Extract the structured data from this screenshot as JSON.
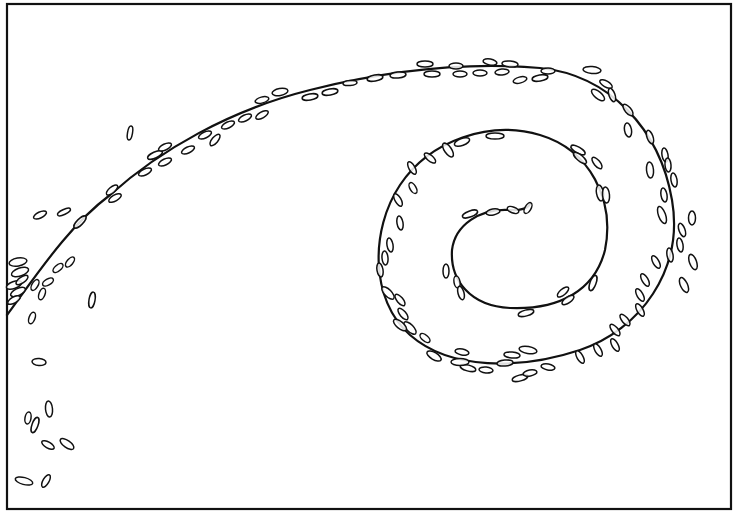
{
  "figure": {
    "width": 735,
    "height": 520,
    "background": "#ffffff",
    "ink": "#111111",
    "frame": {
      "x": 7,
      "y": 4,
      "w": 724,
      "h": 505,
      "stroke_width": 2.2
    },
    "spiral_path": "M 7 315 C 40 270, 70 225, 110 195 C 160 150, 230 110, 310 90 C 390 70, 470 62, 540 68 C 610 75, 660 130, 672 200 C 684 270, 640 330, 580 350 C 520 370, 450 370, 410 335 C 370 300, 370 230, 400 185 C 430 140, 490 120, 540 135 C 590 150, 615 200, 605 250 C 595 290, 560 310, 510 308 C 470 306, 450 280, 452 250 C 455 225, 480 208, 510 210 C 520 211, 528 208, 530 204",
    "particles": [
      {
        "cx": 18,
        "cy": 262,
        "rx": 9,
        "ry": 4,
        "rot": -10
      },
      {
        "cx": 20,
        "cy": 272,
        "rx": 9,
        "ry": 4,
        "rot": -20
      },
      {
        "cx": 14,
        "cy": 285,
        "rx": 8,
        "ry": 3.5,
        "rot": -20
      },
      {
        "cx": 18,
        "cy": 292,
        "rx": 8,
        "ry": 3.5,
        "rot": -25
      },
      {
        "cx": 14,
        "cy": 300,
        "rx": 7,
        "ry": 3,
        "rot": -30
      },
      {
        "cx": 22,
        "cy": 280,
        "rx": 7,
        "ry": 3,
        "rot": -35
      },
      {
        "cx": 35,
        "cy": 285,
        "rx": 6,
        "ry": 3,
        "rot": -60
      },
      {
        "cx": 42,
        "cy": 294,
        "rx": 6,
        "ry": 3,
        "rot": -70
      },
      {
        "cx": 48,
        "cy": 282,
        "rx": 6,
        "ry": 3,
        "rot": -30
      },
      {
        "cx": 58,
        "cy": 268,
        "rx": 6,
        "ry": 3,
        "rot": -40
      },
      {
        "cx": 70,
        "cy": 262,
        "rx": 6,
        "ry": 3,
        "rot": -50
      },
      {
        "cx": 32,
        "cy": 318,
        "rx": 6,
        "ry": 3,
        "rot": -70
      },
      {
        "cx": 92,
        "cy": 300,
        "rx": 8,
        "ry": 3,
        "rot": -80
      },
      {
        "cx": 40,
        "cy": 215,
        "rx": 7,
        "ry": 3,
        "rot": -25
      },
      {
        "cx": 64,
        "cy": 212,
        "rx": 7,
        "ry": 2.5,
        "rot": -25
      },
      {
        "cx": 80,
        "cy": 222,
        "rx": 8,
        "ry": 3,
        "rot": -45
      },
      {
        "cx": 112,
        "cy": 190,
        "rx": 7,
        "ry": 3,
        "rot": -40
      },
      {
        "cx": 115,
        "cy": 198,
        "rx": 7,
        "ry": 3,
        "rot": -30
      },
      {
        "cx": 130,
        "cy": 133,
        "rx": 7,
        "ry": 2.5,
        "rot": -80
      },
      {
        "cx": 155,
        "cy": 155,
        "rx": 8,
        "ry": 3,
        "rot": -25
      },
      {
        "cx": 165,
        "cy": 147,
        "rx": 7,
        "ry": 3,
        "rot": -25
      },
      {
        "cx": 145,
        "cy": 172,
        "rx": 7,
        "ry": 3,
        "rot": -25
      },
      {
        "cx": 165,
        "cy": 162,
        "rx": 7,
        "ry": 3,
        "rot": -25
      },
      {
        "cx": 188,
        "cy": 150,
        "rx": 7,
        "ry": 3,
        "rot": -25
      },
      {
        "cx": 205,
        "cy": 135,
        "rx": 7,
        "ry": 3,
        "rot": -25
      },
      {
        "cx": 215,
        "cy": 140,
        "rx": 7,
        "ry": 3,
        "rot": -50
      },
      {
        "cx": 228,
        "cy": 125,
        "rx": 7,
        "ry": 3,
        "rot": -25
      },
      {
        "cx": 245,
        "cy": 118,
        "rx": 7,
        "ry": 3,
        "rot": -25
      },
      {
        "cx": 262,
        "cy": 115,
        "rx": 7,
        "ry": 3,
        "rot": -30
      },
      {
        "cx": 262,
        "cy": 100,
        "rx": 7,
        "ry": 3,
        "rot": -15
      },
      {
        "cx": 280,
        "cy": 92,
        "rx": 8,
        "ry": 3.5,
        "rot": -10
      },
      {
        "cx": 310,
        "cy": 97,
        "rx": 8,
        "ry": 3,
        "rot": -10
      },
      {
        "cx": 330,
        "cy": 92,
        "rx": 8,
        "ry": 3,
        "rot": -10
      },
      {
        "cx": 350,
        "cy": 83,
        "rx": 7,
        "ry": 2.5,
        "rot": -5
      },
      {
        "cx": 375,
        "cy": 78,
        "rx": 8,
        "ry": 3,
        "rot": -10
      },
      {
        "cx": 398,
        "cy": 75,
        "rx": 8,
        "ry": 3,
        "rot": -5
      },
      {
        "cx": 425,
        "cy": 64,
        "rx": 8,
        "ry": 3,
        "rot": 0
      },
      {
        "cx": 432,
        "cy": 74,
        "rx": 8,
        "ry": 3,
        "rot": 0
      },
      {
        "cx": 456,
        "cy": 66,
        "rx": 7,
        "ry": 3,
        "rot": 0
      },
      {
        "cx": 460,
        "cy": 74,
        "rx": 7,
        "ry": 3,
        "rot": 0
      },
      {
        "cx": 480,
        "cy": 73,
        "rx": 7,
        "ry": 3,
        "rot": 0
      },
      {
        "cx": 490,
        "cy": 62,
        "rx": 7,
        "ry": 3,
        "rot": 10
      },
      {
        "cx": 502,
        "cy": 72,
        "rx": 7,
        "ry": 3,
        "rot": -5
      },
      {
        "cx": 510,
        "cy": 64,
        "rx": 8,
        "ry": 3,
        "rot": 5
      },
      {
        "cx": 520,
        "cy": 80,
        "rx": 7,
        "ry": 3,
        "rot": -15
      },
      {
        "cx": 540,
        "cy": 78,
        "rx": 8,
        "ry": 3,
        "rot": -10
      },
      {
        "cx": 548,
        "cy": 71,
        "rx": 7,
        "ry": 3,
        "rot": 0
      },
      {
        "cx": 592,
        "cy": 70,
        "rx": 9,
        "ry": 3.5,
        "rot": 5
      },
      {
        "cx": 598,
        "cy": 95,
        "rx": 8,
        "ry": 3.5,
        "rot": 40
      },
      {
        "cx": 606,
        "cy": 84,
        "rx": 7,
        "ry": 3,
        "rot": 30
      },
      {
        "cx": 612,
        "cy": 95,
        "rx": 7,
        "ry": 3,
        "rot": 70
      },
      {
        "cx": 628,
        "cy": 110,
        "rx": 7,
        "ry": 3,
        "rot": 50
      },
      {
        "cx": 628,
        "cy": 130,
        "rx": 7,
        "ry": 3.5,
        "rot": 80
      },
      {
        "cx": 650,
        "cy": 137,
        "rx": 7,
        "ry": 3,
        "rot": 70
      },
      {
        "cx": 650,
        "cy": 170,
        "rx": 8,
        "ry": 3.5,
        "rot": 85
      },
      {
        "cx": 665,
        "cy": 155,
        "rx": 7,
        "ry": 3,
        "rot": 80
      },
      {
        "cx": 668,
        "cy": 165,
        "rx": 7,
        "ry": 3,
        "rot": 85
      },
      {
        "cx": 674,
        "cy": 180,
        "rx": 7,
        "ry": 3,
        "rot": 80
      },
      {
        "cx": 664,
        "cy": 195,
        "rx": 7,
        "ry": 3,
        "rot": 80
      },
      {
        "cx": 662,
        "cy": 215,
        "rx": 9,
        "ry": 3.5,
        "rot": 70
      },
      {
        "cx": 692,
        "cy": 218,
        "rx": 7,
        "ry": 3.5,
        "rot": 90
      },
      {
        "cx": 682,
        "cy": 230,
        "rx": 7,
        "ry": 3,
        "rot": 70
      },
      {
        "cx": 680,
        "cy": 245,
        "rx": 7,
        "ry": 3,
        "rot": 80
      },
      {
        "cx": 693,
        "cy": 262,
        "rx": 8,
        "ry": 3.5,
        "rot": 70
      },
      {
        "cx": 684,
        "cy": 285,
        "rx": 8,
        "ry": 3.5,
        "rot": 65
      },
      {
        "cx": 670,
        "cy": 255,
        "rx": 7,
        "ry": 3,
        "rot": 80
      },
      {
        "cx": 656,
        "cy": 262,
        "rx": 7,
        "ry": 3,
        "rot": 60
      },
      {
        "cx": 645,
        "cy": 280,
        "rx": 7,
        "ry": 3,
        "rot": 60
      },
      {
        "cx": 640,
        "cy": 295,
        "rx": 7,
        "ry": 3,
        "rot": 60
      },
      {
        "cx": 640,
        "cy": 310,
        "rx": 7,
        "ry": 3,
        "rot": 60
      },
      {
        "cx": 625,
        "cy": 320,
        "rx": 7,
        "ry": 3,
        "rot": 50
      },
      {
        "cx": 615,
        "cy": 330,
        "rx": 7,
        "ry": 3,
        "rot": 50
      },
      {
        "cx": 615,
        "cy": 345,
        "rx": 7,
        "ry": 3,
        "rot": 60
      },
      {
        "cx": 598,
        "cy": 350,
        "rx": 7,
        "ry": 3,
        "rot": 60
      },
      {
        "cx": 580,
        "cy": 357,
        "rx": 7,
        "ry": 3,
        "rot": 60
      },
      {
        "cx": 548,
        "cy": 367,
        "rx": 7,
        "ry": 3,
        "rot": 10
      },
      {
        "cx": 528,
        "cy": 350,
        "rx": 9,
        "ry": 3.5,
        "rot": 10
      },
      {
        "cx": 512,
        "cy": 355,
        "rx": 8,
        "ry": 3,
        "rot": 5
      },
      {
        "cx": 505,
        "cy": 363,
        "rx": 8,
        "ry": 3,
        "rot": -5
      },
      {
        "cx": 520,
        "cy": 378,
        "rx": 8,
        "ry": 3,
        "rot": -15
      },
      {
        "cx": 530,
        "cy": 373,
        "rx": 7,
        "ry": 3,
        "rot": -10
      },
      {
        "cx": 486,
        "cy": 370,
        "rx": 7,
        "ry": 3,
        "rot": 5
      },
      {
        "cx": 468,
        "cy": 368,
        "rx": 8,
        "ry": 3,
        "rot": 15
      },
      {
        "cx": 460,
        "cy": 362,
        "rx": 9,
        "ry": 3.5,
        "rot": 0
      },
      {
        "cx": 462,
        "cy": 352,
        "rx": 7,
        "ry": 3,
        "rot": 10
      },
      {
        "cx": 434,
        "cy": 356,
        "rx": 8,
        "ry": 3.5,
        "rot": 30
      },
      {
        "cx": 425,
        "cy": 338,
        "rx": 6,
        "ry": 3,
        "rot": 40
      },
      {
        "cx": 410,
        "cy": 328,
        "rx": 8,
        "ry": 3.5,
        "rot": 45
      },
      {
        "cx": 400,
        "cy": 325,
        "rx": 8,
        "ry": 3.5,
        "rot": 40
      },
      {
        "cx": 403,
        "cy": 314,
        "rx": 7,
        "ry": 3,
        "rot": 50
      },
      {
        "cx": 388,
        "cy": 293,
        "rx": 8,
        "ry": 3.5,
        "rot": 45
      },
      {
        "cx": 400,
        "cy": 300,
        "rx": 7,
        "ry": 3,
        "rot": 50
      },
      {
        "cx": 380,
        "cy": 270,
        "rx": 7,
        "ry": 3,
        "rot": 80
      },
      {
        "cx": 385,
        "cy": 258,
        "rx": 7,
        "ry": 3,
        "rot": 85
      },
      {
        "cx": 390,
        "cy": 245,
        "rx": 7,
        "ry": 3,
        "rot": 80
      },
      {
        "cx": 400,
        "cy": 223,
        "rx": 7,
        "ry": 3,
        "rot": 80
      },
      {
        "cx": 398,
        "cy": 200,
        "rx": 7,
        "ry": 3,
        "rot": 60
      },
      {
        "cx": 413,
        "cy": 188,
        "rx": 6,
        "ry": 3,
        "rot": 60
      },
      {
        "cx": 412,
        "cy": 168,
        "rx": 7,
        "ry": 3,
        "rot": 60
      },
      {
        "cx": 430,
        "cy": 158,
        "rx": 7,
        "ry": 3,
        "rot": 40
      },
      {
        "cx": 448,
        "cy": 150,
        "rx": 8,
        "ry": 3.5,
        "rot": 55
      },
      {
        "cx": 462,
        "cy": 142,
        "rx": 8,
        "ry": 3.5,
        "rot": -20
      },
      {
        "cx": 495,
        "cy": 136,
        "rx": 9,
        "ry": 3,
        "rot": 0
      },
      {
        "cx": 578,
        "cy": 150,
        "rx": 8,
        "ry": 3,
        "rot": 30
      },
      {
        "cx": 580,
        "cy": 158,
        "rx": 8,
        "ry": 3,
        "rot": 40
      },
      {
        "cx": 597,
        "cy": 163,
        "rx": 7,
        "ry": 3,
        "rot": 50
      },
      {
        "cx": 600,
        "cy": 193,
        "rx": 8,
        "ry": 3.5,
        "rot": 80
      },
      {
        "cx": 606,
        "cy": 195,
        "rx": 8,
        "ry": 3.5,
        "rot": 85
      },
      {
        "cx": 446,
        "cy": 271,
        "rx": 7,
        "ry": 3,
        "rot": 90
      },
      {
        "cx": 457,
        "cy": 282,
        "rx": 6,
        "ry": 3,
        "rot": 80
      },
      {
        "cx": 461,
        "cy": 293,
        "rx": 7,
        "ry": 3,
        "rot": 75
      },
      {
        "cx": 526,
        "cy": 313,
        "rx": 8,
        "ry": 3,
        "rot": -15
      },
      {
        "cx": 563,
        "cy": 292,
        "rx": 7,
        "ry": 3,
        "rot": -40
      },
      {
        "cx": 568,
        "cy": 300,
        "rx": 7,
        "ry": 3,
        "rot": -35
      },
      {
        "cx": 593,
        "cy": 283,
        "rx": 8,
        "ry": 3,
        "rot": -70
      },
      {
        "cx": 470,
        "cy": 214,
        "rx": 8,
        "ry": 3,
        "rot": -20
      },
      {
        "cx": 493,
        "cy": 212,
        "rx": 7,
        "ry": 3,
        "rot": -10
      },
      {
        "cx": 513,
        "cy": 210,
        "rx": 6,
        "ry": 3,
        "rot": 20
      },
      {
        "cx": 528,
        "cy": 208,
        "rx": 6,
        "ry": 3,
        "rot": -60
      },
      {
        "cx": 39,
        "cy": 362,
        "rx": 7,
        "ry": 3.5,
        "rot": 5
      },
      {
        "cx": 28,
        "cy": 418,
        "rx": 6,
        "ry": 3,
        "rot": -80
      },
      {
        "cx": 35,
        "cy": 425,
        "rx": 8,
        "ry": 3,
        "rot": -70
      },
      {
        "cx": 49,
        "cy": 409,
        "rx": 8,
        "ry": 3.5,
        "rot": 85
      },
      {
        "cx": 48,
        "cy": 445,
        "rx": 7,
        "ry": 3,
        "rot": 30
      },
      {
        "cx": 67,
        "cy": 444,
        "rx": 8,
        "ry": 3.5,
        "rot": 35
      },
      {
        "cx": 24,
        "cy": 481,
        "rx": 9,
        "ry": 3.5,
        "rot": 15
      },
      {
        "cx": 46,
        "cy": 481,
        "rx": 7,
        "ry": 3,
        "rot": -60
      }
    ]
  }
}
